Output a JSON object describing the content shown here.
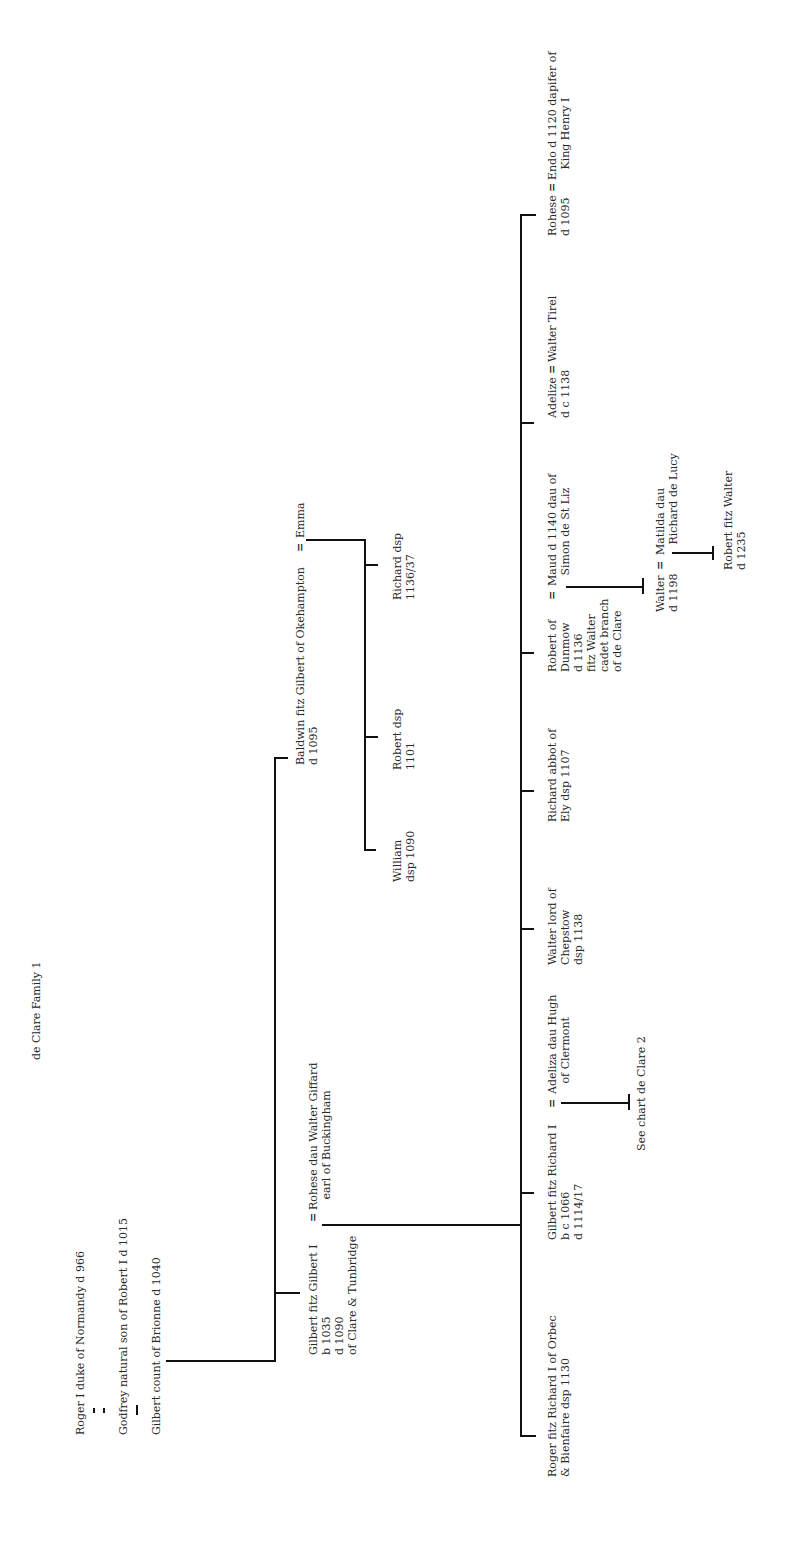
{
  "title": "de Clare Family 1",
  "people": {
    "roger_normandy": "Roger I duke of Normandy d 966",
    "godfrey": "Godfrey natural son of Robert I d 1015",
    "gilbert_brionne": "Gilbert count of Brionne d 1040",
    "gilbert_fitz_gilbert": [
      "Gilbert fitz Gilbert I",
      "b 1035",
      "d 1090",
      "of Clare & Tunbridge"
    ],
    "rohese_giffard": [
      "Rohese dau Walter Giffard",
      "   earl of Buckingham"
    ],
    "baldwin": [
      "Baldwin fitz Gilbert of Okehampton",
      "d 1095"
    ],
    "emma": "Emma",
    "william": [
      "William",
      "dsp 1090"
    ],
    "robert_dsp": [
      "Robert dsp",
      "1101"
    ],
    "richard_dsp": [
      "Richard dsp",
      "1136/37"
    ],
    "roger_orbec": [
      "Roger fitz Richard I of Orbec",
      "& Bienfaire dsp 1130"
    ],
    "gilbert_fitz_richard": [
      "Gilbert fitz Richard I",
      "b c 1066",
      "d 1114/17"
    ],
    "adeliza": [
      "Adeliza dau Hugh",
      "   of Clermont"
    ],
    "see_chart": "See chart de Clare 2",
    "walter_chepstow": [
      "Walter lord of",
      "Chepstow",
      "dsp 1138"
    ],
    "richard_abbot": [
      "Richard abbot of",
      "Ely dsp 1107"
    ],
    "robert_dunmow": [
      "Robert of",
      "Dunmow",
      "d 1136",
      "fitz Walter",
      "cadet branch",
      "of de Clare"
    ],
    "maud": [
      "Maud d 1140 dau of",
      "   Simon de St Liz"
    ],
    "walter_1198": [
      "Walter",
      "d 1198"
    ],
    "matilda": [
      "Matilda dau",
      "   Richard de Lucy"
    ],
    "robert_fitz_walter": [
      "Robert fitz Walter",
      "d 1235"
    ],
    "adelize": [
      "Adelize",
      "d c 1138"
    ],
    "walter_tirel": "Walter Tirel",
    "rohese_1095": [
      "Rohese",
      "d 1095"
    ],
    "endo": [
      "Endo d 1120 dapifer of",
      "   King Henry I"
    ]
  },
  "marriage_symbol": "="
}
